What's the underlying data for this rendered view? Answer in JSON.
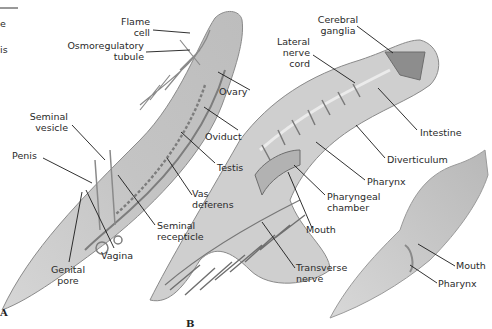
{
  "figure": {
    "panels": [
      {
        "id": "A",
        "label": "A"
      },
      {
        "id": "B",
        "label": "B"
      }
    ],
    "cropped_text": {
      "line_top_left": true,
      "fragment_1": "e",
      "fragment_2": "is"
    },
    "panel_a_labels": {
      "flame_cell": "Flame cell",
      "flame_cell_l1": "Flame",
      "flame_cell_l2": "cell",
      "osmo_l1": "Osmoregulatory",
      "osmo_l2": "tubule",
      "seminal_vesicle_l1": "Seminal",
      "seminal_vesicle_l2": "vesicle",
      "penis": "Penis",
      "ovary": "Ovary",
      "oviduct": "Oviduct",
      "testis": "Testis",
      "vas_l1": "Vas",
      "vas_l2": "deferens",
      "sem_rec_l1": "Seminal",
      "sem_rec_l2": "recepticle",
      "vagina": "Vagina",
      "genital_l1": "Genital",
      "genital_l2": "pore"
    },
    "panel_b_labels": {
      "cerebral_l1": "Cerebral",
      "cerebral_l2": "ganglia",
      "lateral_l1": "Lateral",
      "lateral_l2": "nerve",
      "lateral_l3": "cord",
      "intestine": "Intestine",
      "diverticulum": "Diverticulum",
      "pharynx": "Pharynx",
      "phar_ch_l1": "Pharyngeal",
      "phar_ch_l2": "chamber",
      "mouth": "Mouth",
      "transverse_l1": "Transverse",
      "transverse_l2": "nerve"
    },
    "panel_c_labels": {
      "mouth": "Mouth",
      "pharynx": "Pharynx"
    },
    "colors": {
      "body_fill": "#c9c9c9",
      "body_edge": "#8a8a8a",
      "organ": "#7d7d7d",
      "leader": "#1a1a1a"
    }
  }
}
